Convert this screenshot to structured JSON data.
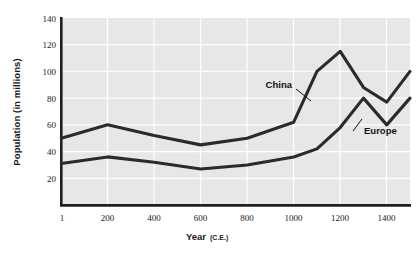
{
  "chart_data": {
    "type": "line",
    "title": "",
    "xlabel": "Year (C.E.)",
    "xlabel_main": "Year",
    "xlabel_sub": "(C.E.)",
    "ylabel": "Population (in millions)",
    "xlim": [
      1,
      1500
    ],
    "ylim": [
      0,
      140
    ],
    "yticks": [
      20,
      40,
      60,
      80,
      100,
      120,
      140
    ],
    "xticks": [
      1,
      200,
      400,
      600,
      800,
      1000,
      1200,
      1400
    ],
    "grid": true,
    "legend_position": "inline-annotations",
    "series": [
      {
        "name": "China",
        "label_x": 1010,
        "label_y": 97,
        "x": [
          1,
          200,
          400,
          600,
          800,
          1000,
          1100,
          1200,
          1300,
          1400,
          1500
        ],
        "values": [
          50,
          60,
          52,
          45,
          50,
          62,
          100,
          115,
          88,
          77,
          100
        ]
      },
      {
        "name": "Europe",
        "label_x": 1280,
        "label_y": 56,
        "x": [
          1,
          200,
          400,
          600,
          800,
          1000,
          1100,
          1200,
          1300,
          1400,
          1500
        ],
        "values": [
          31,
          36,
          32,
          27,
          30,
          36,
          42,
          58,
          80,
          60,
          80
        ]
      }
    ]
  },
  "axis": {
    "yticks_text": [
      "140",
      "120",
      "100",
      "80",
      "60",
      "40",
      "20"
    ],
    "xticks_text": [
      "1",
      "200",
      "400",
      "600",
      "800",
      "1000",
      "1200",
      "1400"
    ]
  },
  "annotations": {
    "china": "China",
    "europe": "Europe"
  },
  "colors": {
    "line": "#2b2b2b",
    "plot_background": "#e7e7e7",
    "gridline": "#ffffff",
    "axis": "#1f1f1f",
    "text": "#1a1a1a",
    "page_background": "#ffffff"
  }
}
